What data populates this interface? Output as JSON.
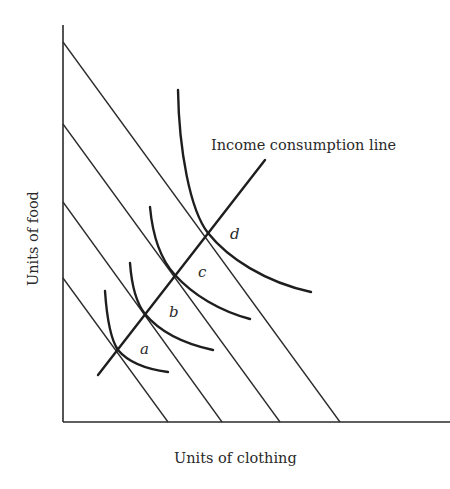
{
  "diagram": {
    "type": "indifference-curve-analysis",
    "x_axis_label": "Units of clothing",
    "y_axis_label": "Units of food",
    "line_label": "Income consumption line",
    "points": [
      {
        "id": "a",
        "label": "a"
      },
      {
        "id": "b",
        "label": "b"
      },
      {
        "id": "c",
        "label": "c"
      },
      {
        "id": "d",
        "label": "d"
      }
    ],
    "budget_lines_count": 4,
    "indifference_curves_count": 4
  },
  "colors": {
    "ink": "#1e1e1e",
    "background": "#ffffff"
  }
}
